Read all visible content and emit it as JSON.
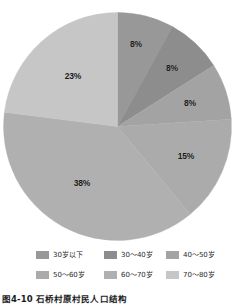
{
  "caption": "图4-10 石桥村原村民人口结构",
  "legend": {
    "rows": [
      [
        {
          "label": "30岁以下",
          "color": "#989898"
        },
        {
          "label": "30～40岁",
          "color": "#8d8d8d"
        },
        {
          "label": "40～50岁",
          "color": "#a3a3a3"
        }
      ],
      [
        {
          "label": "50～60岁",
          "color": "#ababab"
        },
        {
          "label": "60～70岁",
          "color": "#b0b0b0"
        },
        {
          "label": "70～80岁",
          "color": "#c6c6c6"
        }
      ]
    ]
  },
  "chart_data": {
    "type": "pie",
    "title": "图4-10 石桥村原村民人口结构",
    "xlabel": "",
    "ylabel": "",
    "categories": [
      "30岁以下",
      "30～40岁",
      "40～50岁",
      "50～60岁",
      "60～70岁",
      "70～80岁"
    ],
    "values": [
      8,
      8,
      8,
      15,
      38,
      23
    ],
    "value_unit": "%",
    "data_labels": [
      "8%",
      "8%",
      "8%",
      "15%",
      "38%",
      "23%"
    ],
    "colors": [
      "#989898",
      "#8d8d8d",
      "#a3a3a3",
      "#ababab",
      "#b0b0b0",
      "#c6c6c6"
    ],
    "start_angle_deg": 0,
    "direction": "clockwise",
    "grid": false,
    "legend_position": "bottom",
    "geometry": {
      "cx": 117.5,
      "cy": 126.5,
      "r": 114
    },
    "label_positions": [
      {
        "label": "8%",
        "x": 136,
        "y": 44
      },
      {
        "label": "8%",
        "x": 172,
        "y": 68
      },
      {
        "label": "8%",
        "x": 190,
        "y": 103
      },
      {
        "label": "15%",
        "x": 186,
        "y": 156
      },
      {
        "label": "38%",
        "x": 82,
        "y": 183
      },
      {
        "label": "23%",
        "x": 73,
        "y": 76
      }
    ],
    "slices": [
      {
        "name": "30岁以下",
        "value": 8,
        "label": "8%",
        "color": "#989898",
        "start_deg": 0,
        "end_deg": 28.8
      },
      {
        "name": "30～40岁",
        "value": 8,
        "label": "8%",
        "color": "#8d8d8d",
        "start_deg": 28.8,
        "end_deg": 57.6
      },
      {
        "name": "40～50岁",
        "value": 8,
        "label": "8%",
        "color": "#a3a3a3",
        "start_deg": 57.6,
        "end_deg": 86.4
      },
      {
        "name": "50～60岁",
        "value": 15,
        "label": "15%",
        "color": "#ababab",
        "start_deg": 86.4,
        "end_deg": 140.4
      },
      {
        "name": "60～70岁",
        "value": 38,
        "label": "38%",
        "color": "#b0b0b0",
        "start_deg": 140.4,
        "end_deg": 277.2
      },
      {
        "name": "70～80岁",
        "value": 23,
        "label": "23%",
        "color": "#c6c6c6",
        "start_deg": 277.2,
        "end_deg": 360
      }
    ]
  }
}
